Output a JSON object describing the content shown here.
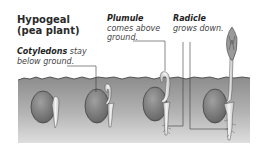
{
  "title": {
    "line1": "Hypogeal",
    "line2": "(pea plant)"
  },
  "labels": {
    "cotyledons": {
      "term": "Cotyledons",
      "rest1": " stay",
      "rest2": "below ground."
    },
    "plumule": {
      "term": "Plumule",
      "rest1": "comes above",
      "rest2": "ground."
    },
    "radicle": {
      "term": "Radicle",
      "rest1": "grows down."
    }
  },
  "stages": [
    {
      "id": 1,
      "description": "seed with emerging radicle"
    },
    {
      "id": 2,
      "description": "radicle grows down, plumule hooked"
    },
    {
      "id": 3,
      "description": "plumule hook emerges above soil"
    },
    {
      "id": 4,
      "description": "shoot with leaves above ground, cotyledons below"
    }
  ],
  "colors": {
    "soil_top": "#8f8f8f",
    "soil_bottom": "#d6d6d6",
    "seed": "#7a7a7a",
    "text": "#2a2a2a"
  }
}
